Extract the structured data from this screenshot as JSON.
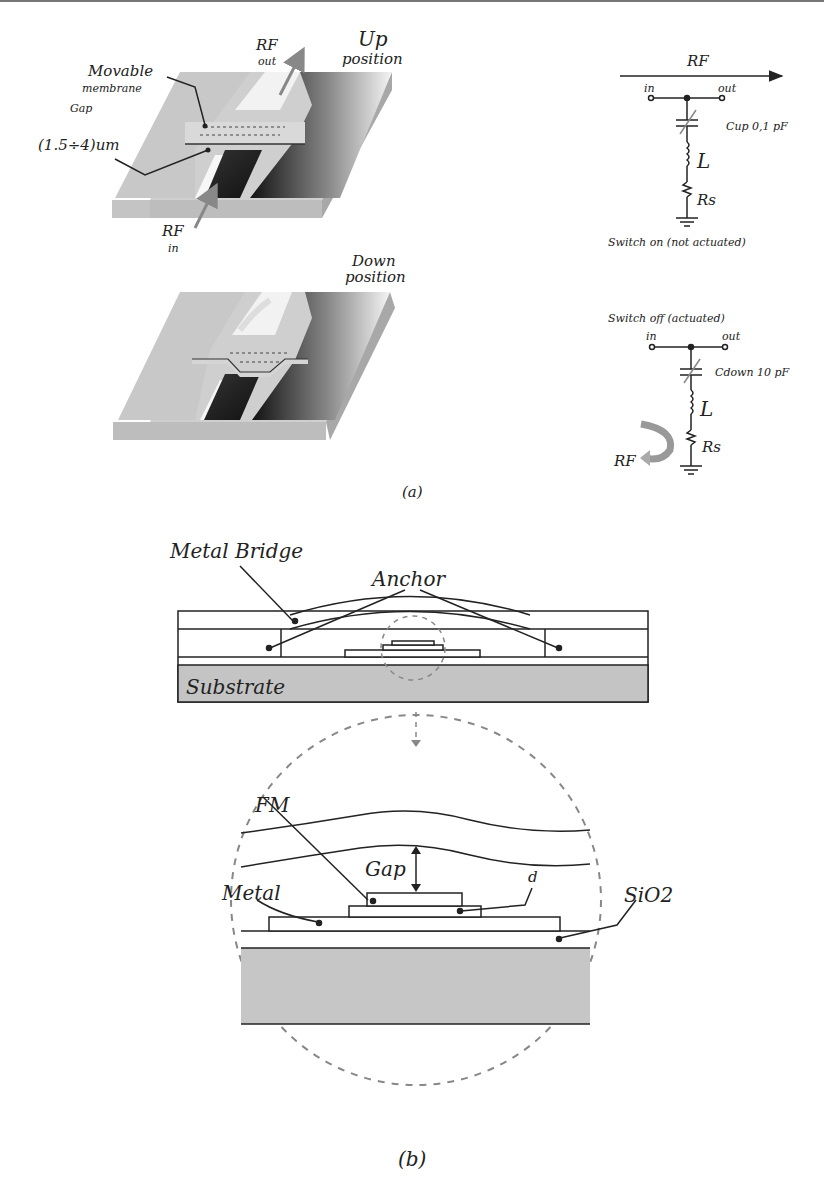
{
  "figure": {
    "panel_a": {
      "caption": "(a)",
      "up_state": {
        "position_label_line1": "Up",
        "position_label_line2": "position",
        "rf_out_line1": "RF",
        "rf_out_line2": "out",
        "rf_in_line1": "RF",
        "rf_in_line2": "in",
        "membrane_label_line1": "Movable",
        "membrane_label_line2": "membrane",
        "gap_label_line1": "Gap",
        "gap_label_line2": "(1.5÷4)um"
      },
      "down_state": {
        "position_label_line1": "Down",
        "position_label_line2": "position"
      },
      "circuit_on": {
        "rf_label": "RF",
        "in_label": "in",
        "out_label": "out",
        "capacitor_label": "Cup 0,1 pF",
        "inductor_label": "L",
        "resistor_label": "Rs",
        "caption": "Switch on (not actuated)"
      },
      "circuit_off": {
        "title": "Switch off (actuated)",
        "in_label": "in",
        "out_label": "out",
        "capacitor_label": "Cdown 10 pF",
        "inductor_label": "L",
        "resistor_label": "Rs",
        "rf_label": "RF"
      }
    },
    "panel_b": {
      "caption": "(b)",
      "cross_section": {
        "bridge_label": "Metal Bridge",
        "anchor_label": "Anchor",
        "substrate_label": "Substrate"
      },
      "detail": {
        "fm_label": "FM",
        "gap_label": "Gap",
        "d_label": "d",
        "metal_label": "Metal",
        "sio2_label": "SiO2"
      }
    }
  }
}
